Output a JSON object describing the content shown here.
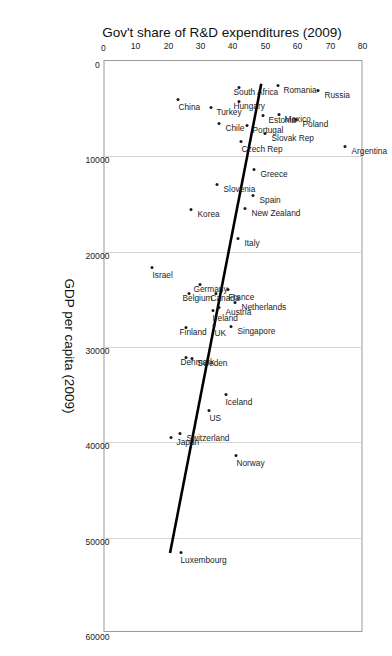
{
  "chart_data": {
    "type": "scatter",
    "title": "",
    "xlabel": "GDP per capita (2009)",
    "ylabel": "Gov't share of R&D expenditures (2009)",
    "xlim": [
      0,
      60000
    ],
    "ylim": [
      0,
      80
    ],
    "xticks": [
      0,
      10000,
      20000,
      30000,
      40000,
      50000,
      60000
    ],
    "xticklabels": [
      "0",
      "10000",
      "20000",
      "30000",
      "40000",
      "50000",
      "60000"
    ],
    "yticks": [
      0,
      10,
      20,
      30,
      40,
      50,
      60,
      70,
      80
    ],
    "yticklabels": [
      "0",
      "10",
      "20",
      "30",
      "40",
      "50",
      "60",
      "70",
      "80"
    ],
    "grid": "vertical-only",
    "legend": "none",
    "rotation": "figure rotated 90 degrees",
    "trendline": {
      "present": true,
      "style": "solid-black-thick",
      "x_start": 2400,
      "y_start": 48.8,
      "x_end": 51800,
      "y_end": 20.4
    },
    "points": [
      {
        "label": "Argentina",
        "x": 9000,
        "y": 75.0,
        "lbl": "up"
      },
      {
        "label": "Russia",
        "x": 3100,
        "y": 66.6,
        "lbl": "up"
      },
      {
        "label": "Poland",
        "x": 6100,
        "y": 59.8,
        "lbl": "up"
      },
      {
        "label": "Mexico",
        "x": 5600,
        "y": 54.5,
        "lbl": "up"
      },
      {
        "label": "Romania",
        "x": 2600,
        "y": 54.1,
        "lbl": "up"
      },
      {
        "label": "Slovak Rep",
        "x": 7600,
        "y": 50.2,
        "lbl": "up"
      },
      {
        "label": "Estonia",
        "x": 5700,
        "y": 49.5,
        "lbl": "up"
      },
      {
        "label": "Portugal",
        "x": 6800,
        "y": 44.6,
        "lbl": "up"
      },
      {
        "label": "Greece",
        "x": 11400,
        "y": 46.8,
        "lbl": "up"
      },
      {
        "label": "Spain",
        "x": 14100,
        "y": 46.6,
        "lbl": "up"
      },
      {
        "label": "New Zealand",
        "x": 15500,
        "y": 44.1,
        "lbl": "up"
      },
      {
        "label": "Czech Rep",
        "x": 8400,
        "y": 42.9,
        "lbl": "right2"
      },
      {
        "label": "South Africa",
        "x": 2800,
        "y": 42.3,
        "lbl": "down2"
      },
      {
        "label": "Hungary",
        "x": 4300,
        "y": 42.2,
        "lbl": "down"
      },
      {
        "label": "Italy",
        "x": 18600,
        "y": 42.0,
        "lbl": "up"
      },
      {
        "label": "Chile",
        "x": 6600,
        "y": 36.0,
        "lbl": "up"
      },
      {
        "label": "Slovenia",
        "x": 13000,
        "y": 35.5,
        "lbl": "up"
      },
      {
        "label": "Netherlands",
        "x": 25300,
        "y": 41.0,
        "lbl": "up"
      },
      {
        "label": "France",
        "x": 24000,
        "y": 38.9,
        "lbl": "right"
      },
      {
        "label": "Singapore",
        "x": 27800,
        "y": 39.8,
        "lbl": "up"
      },
      {
        "label": "Canada",
        "x": 24400,
        "y": 35.2,
        "lbl": "down"
      },
      {
        "label": "Austria",
        "x": 25900,
        "y": 36.0,
        "lbl": "up"
      },
      {
        "label": "Turkey",
        "x": 4900,
        "y": 33.5,
        "lbl": "up"
      },
      {
        "label": "US",
        "x": 36700,
        "y": 33.0,
        "lbl": "right"
      },
      {
        "label": "Iceland",
        "x": 35000,
        "y": 38.0,
        "lbl": "right"
      },
      {
        "label": "Norway",
        "x": 41400,
        "y": 41.3,
        "lbl": "right"
      },
      {
        "label": "Ireland",
        "x": 26200,
        "y": 34.0,
        "lbl": "right"
      },
      {
        "label": "UK",
        "x": 27700,
        "y": 34.5,
        "lbl": "right"
      },
      {
        "label": "Germany",
        "x": 23400,
        "y": 30.1,
        "lbl": "down"
      },
      {
        "label": "Korea",
        "x": 15600,
        "y": 27.4,
        "lbl": "up"
      },
      {
        "label": "Belgium",
        "x": 24400,
        "y": 26.6,
        "lbl": "down"
      },
      {
        "label": "Sweden",
        "x": 31200,
        "y": 27.5,
        "lbl": "up"
      },
      {
        "label": "Denmark",
        "x": 31100,
        "y": 25.8,
        "lbl": "down"
      },
      {
        "label": "Finland",
        "x": 28000,
        "y": 25.7,
        "lbl": "down"
      },
      {
        "label": "Switzerland",
        "x": 39100,
        "y": 24.0,
        "lbl": "up"
      },
      {
        "label": "China",
        "x": 4000,
        "y": 23.4,
        "lbl": "right"
      },
      {
        "label": "Japan",
        "x": 39500,
        "y": 21.1,
        "lbl": "up"
      },
      {
        "label": "Israel",
        "x": 21700,
        "y": 15.3,
        "lbl": "right"
      },
      {
        "label": "Luxembourg",
        "x": 51600,
        "y": 24.1,
        "lbl": "right"
      }
    ]
  },
  "axes": {
    "x_title": "GDP per capita (2009)",
    "y_title": "Gov't share of R&D expenditures (2009)"
  }
}
